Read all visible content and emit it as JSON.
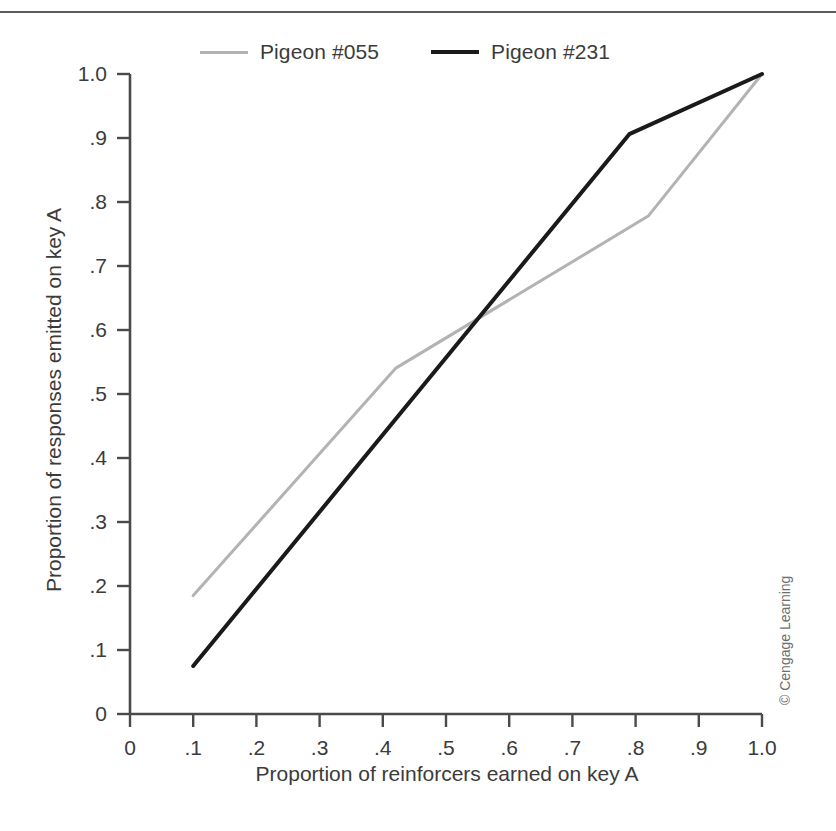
{
  "figure": {
    "credit": "© Cengage Learning"
  },
  "legend": {
    "position": "top-center",
    "entries": [
      {
        "label": "Pigeon #055",
        "color": "#b3b3b3",
        "icon": "line-swatch-icon"
      },
      {
        "label": "Pigeon #231",
        "color": "#1a1a1a",
        "icon": "line-swatch-icon"
      }
    ]
  },
  "chart_data": {
    "type": "line",
    "title": "",
    "subtitle": "",
    "xlabel": "Proportion of reinforcers earned on key A",
    "ylabel": "Proportion of responses emitted on key A",
    "xlim": [
      0,
      1.0
    ],
    "ylim": [
      0,
      1.0
    ],
    "grid": false,
    "legend_position": "top-center",
    "xticks": [
      0,
      0.1,
      0.2,
      0.3,
      0.4,
      0.5,
      0.6,
      0.7,
      0.8,
      0.9,
      1.0
    ],
    "xtick_labels": [
      "0",
      ".1",
      ".2",
      ".3",
      ".4",
      ".5",
      ".6",
      ".7",
      ".8",
      ".9",
      "1.0"
    ],
    "yticks": [
      0,
      0.1,
      0.2,
      0.3,
      0.4,
      0.5,
      0.6,
      0.7,
      0.8,
      0.9,
      1.0
    ],
    "ytick_labels": [
      "0",
      ".1",
      ".2",
      ".3",
      ".4",
      ".5",
      ".6",
      ".7",
      ".8",
      ".9",
      "1.0"
    ],
    "series": [
      {
        "name": "Pigeon #055",
        "color": "#b3b3b3",
        "linewidth": 3,
        "x": [
          0.1,
          0.42,
          0.82,
          1.0
        ],
        "y": [
          0.185,
          0.54,
          0.778,
          1.0
        ]
      },
      {
        "name": "Pigeon #231",
        "color": "#1a1a1a",
        "linewidth": 4,
        "x": [
          0.1,
          0.79,
          1.0
        ],
        "y": [
          0.075,
          0.906,
          1.0
        ]
      }
    ],
    "annotations": [
      "The two functions cross at approximately (.56, .62)."
    ]
  },
  "axes_geometry": {
    "left": 130,
    "right": 762,
    "top": 74,
    "bottom": 714,
    "axis_color": "#4a4a4a"
  }
}
